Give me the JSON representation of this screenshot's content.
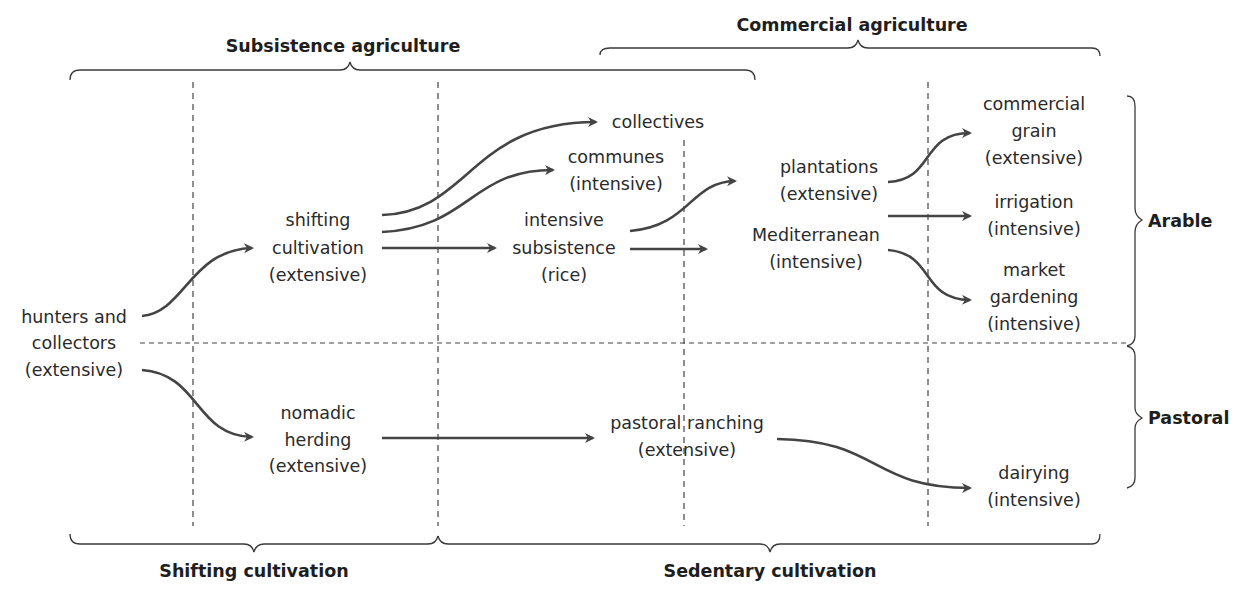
{
  "headings": {
    "subsistence": "Subsistence agriculture",
    "commercial": "Commercial agriculture",
    "shifting": "Shifting cultivation",
    "sedentary": "Sedentary cultivation",
    "arable": "Arable",
    "pastoral": "Pastoral"
  },
  "nodes": {
    "hunters": [
      "hunters and",
      "collectors",
      "(extensive)"
    ],
    "shifting_cultivation": [
      "shifting",
      "cultivation",
      "(extensive)"
    ],
    "nomadic_herding": [
      "nomadic",
      "herding",
      "(extensive)"
    ],
    "collectives": [
      "collectives"
    ],
    "communes": [
      "communes",
      "(intensive)"
    ],
    "intensive_subsistence": [
      "intensive",
      "subsistence",
      "(rice)"
    ],
    "pastoral_ranching": [
      "pastoral ranching",
      "(extensive)"
    ],
    "plantations": [
      "plantations",
      "(extensive)"
    ],
    "mediterranean": [
      "Mediterranean",
      "(intensive)"
    ],
    "commercial_grain": [
      "commercial",
      "grain",
      "(extensive)"
    ],
    "irrigation": [
      "irrigation",
      "(intensive)"
    ],
    "market_gardening": [
      "market",
      "gardening",
      "(intensive)"
    ],
    "dairying": [
      "dairying",
      "(intensive)"
    ]
  },
  "colors": {
    "arrow": "#444444",
    "text": "#2a2a2a",
    "background": "#ffffff"
  }
}
